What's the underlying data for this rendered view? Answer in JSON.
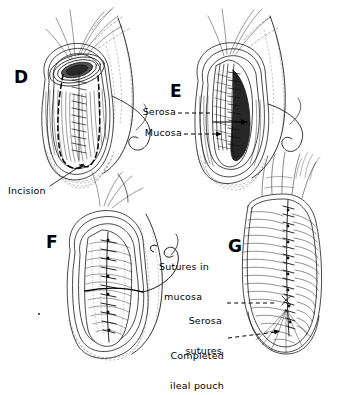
{
  "figure": {
    "type": "medical-surgical-illustration",
    "style": "black-and-white pen-and-ink line drawing",
    "background_color": "#ffffff",
    "ink_color": "#000000",
    "panel_count": 4
  },
  "panels": [
    {
      "id": "D",
      "letter": "D",
      "position": {
        "x": 14,
        "y": 68
      },
      "description": "Opened ileal limbs with dashed incision outline and running suture line"
    },
    {
      "id": "E",
      "letter": "E",
      "position": {
        "x": 170,
        "y": 82
      },
      "description": "Cut-away view showing serosa and mucosa layers with arrow indicating the plane"
    },
    {
      "id": "F",
      "letter": "F",
      "position": {
        "x": 46,
        "y": 233
      },
      "description": "Pouch interior with continuous mucosal suture line"
    },
    {
      "id": "G",
      "letter": "G",
      "position": {
        "x": 228,
        "y": 237
      },
      "description": "Closed pouch exterior with serosal suture line"
    }
  ],
  "annotations": [
    {
      "id": "serosa-d",
      "text": "Serosa",
      "panel": "E",
      "leader": "dashed",
      "align": "right",
      "position": {
        "x": 136,
        "y": 110
      }
    },
    {
      "id": "mucosa-d",
      "text": "Mucosa",
      "panel": "E",
      "leader": "dashed",
      "align": "right",
      "position": {
        "x": 136,
        "y": 131
      }
    },
    {
      "id": "incision",
      "text": "Incision",
      "panel": "D",
      "leader": "solid",
      "align": "left",
      "position": {
        "x": 8,
        "y": 186
      }
    },
    {
      "id": "sutures-in-mucosa",
      "text": "Sutures in\nmucosa",
      "line1": "Sutures in",
      "line2": "mucosa",
      "panel": "F",
      "leader": "solid-hook",
      "align": "left",
      "position": {
        "x": 159,
        "y": 242
      }
    },
    {
      "id": "serosa-sutures",
      "text": "Serosa\nsutures",
      "line1": "Serosa",
      "line2": "sutures",
      "panel": "G",
      "leader": "dashed",
      "align": "right",
      "position": {
        "x": 186,
        "y": 299
      }
    },
    {
      "id": "completed-ileal-pouch",
      "text": "Completed\nileal pouch",
      "line1": "Completed",
      "line2": "ileal pouch",
      "panel": "G",
      "leader": "dashed",
      "align": "right",
      "position": {
        "x": 166,
        "y": 334
      }
    }
  ]
}
